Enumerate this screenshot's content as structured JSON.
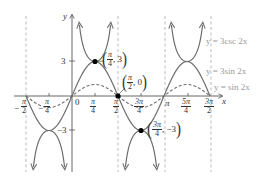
{
  "chart_data": {
    "type": "line",
    "title": "",
    "xlabel": "x",
    "ylabel": "y",
    "xlim": [
      "-π/2",
      "3π/2"
    ],
    "ylim": [
      -5.5,
      6.5
    ],
    "grid": false,
    "x_ticks": [
      {
        "num": "π",
        "den": "2",
        "sign": "−",
        "value": -1.5708
      },
      {
        "num": "π",
        "den": "4",
        "sign": "−",
        "value": -0.7854
      },
      {
        "label": "0",
        "value": 0
      },
      {
        "num": "π",
        "den": "4",
        "sign": "",
        "value": 0.7854
      },
      {
        "num": "π",
        "den": "2",
        "sign": "",
        "value": 1.5708
      },
      {
        "num": "3π",
        "den": "4",
        "sign": "",
        "value": 2.3562
      },
      {
        "label": "π",
        "value": 3.1416
      },
      {
        "num": "5π",
        "den": "4",
        "sign": "",
        "value": 3.927
      },
      {
        "num": "3π",
        "den": "2",
        "sign": "",
        "value": 4.7124
      }
    ],
    "y_ticks": [
      {
        "label": "3",
        "value": 3
      },
      {
        "label": "−3",
        "value": -3
      }
    ],
    "asymptotes_x": [
      "-π/2",
      "π/2",
      "π",
      "3π/2"
    ],
    "series": [
      {
        "name": "y = 3csc 2x",
        "style": "solid-arrows",
        "color": "#707070",
        "formula": "3/sin(2x)"
      },
      {
        "name": "y = 3sin 2x",
        "style": "solid",
        "color": "#707070",
        "formula": "3*sin(2x)"
      },
      {
        "name": "y = sin 2x",
        "style": "dashed",
        "color": "#707070",
        "formula": "sin(2x)"
      }
    ],
    "annotations": [
      {
        "point": [
          "π/4",
          3
        ],
        "label_num": "π",
        "label_den": "4",
        "label_y": "3"
      },
      {
        "point": [
          "π/2",
          0
        ],
        "label_num": "π",
        "label_den": "2",
        "label_y": "0"
      },
      {
        "point": [
          "3π/4",
          -3
        ],
        "label_num": "3π",
        "label_den": "4",
        "label_y": "−3"
      }
    ]
  },
  "axes": {
    "x_label": "x",
    "y_label": "y",
    "origin_label": "0"
  },
  "legend": {
    "csc": "y = 3csc 2x",
    "sin3": "y = 3sin 2x",
    "sin1": "y = sin 2x"
  },
  "ticks": {
    "x": [
      {
        "sign": "−",
        "num": "π",
        "den": "2"
      },
      {
        "sign": "",
        "num": "π",
        "den": "4"
      },
      {
        "sign": "",
        "num": "π",
        "den": "4"
      },
      {
        "sign": "",
        "num": "π",
        "den": "2"
      },
      {
        "sign": "",
        "num": "3π",
        "den": "4"
      },
      {
        "label": "π"
      },
      {
        "sign": "",
        "num": "5π",
        "den": "4"
      },
      {
        "sign": "",
        "num": "3π",
        "den": "2"
      }
    ],
    "y_pos": "3",
    "y_neg": "−3"
  },
  "points": {
    "p1": {
      "num": "π",
      "den": "4",
      "y": "3"
    },
    "p2": {
      "num": "π",
      "den": "2",
      "y": "0"
    },
    "p3": {
      "num": "3π",
      "den": "4",
      "y": "−3"
    }
  },
  "colors": {
    "curve": "#6e6e6e",
    "axis": "#555555",
    "asymptote": "#aaaaaa",
    "legend": "#9a9a9a"
  }
}
